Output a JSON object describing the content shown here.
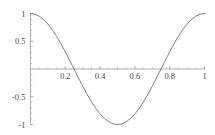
{
  "chart_data": {
    "type": "line",
    "title": "",
    "subtitle": "",
    "xlabel": "",
    "ylabel": "",
    "xlim": [
      0,
      1
    ],
    "ylim": [
      -1,
      1
    ],
    "grid": false,
    "legend": null,
    "legend_position": "none",
    "function": "cos(2*pi*x)",
    "x_ticks": [
      {
        "value": 0.2,
        "label": "0.2"
      },
      {
        "value": 0.4,
        "label": "0.4"
      },
      {
        "value": 0.6,
        "label": "0.6"
      },
      {
        "value": 0.8,
        "label": "0.8"
      },
      {
        "value": 1.0,
        "label": "1"
      }
    ],
    "x_minor_ticks": [
      0.05,
      0.1,
      0.15,
      0.25,
      0.3,
      0.35,
      0.45,
      0.5,
      0.55,
      0.65,
      0.7,
      0.75,
      0.85,
      0.9,
      0.95
    ],
    "y_ticks": [
      {
        "value": 1.0,
        "label": "1"
      },
      {
        "value": 0.5,
        "label": "0.5"
      },
      {
        "value": -0.5,
        "label": "-0.5"
      },
      {
        "value": -1.0,
        "label": "-1"
      }
    ],
    "y_minor_ticks": [
      0.9,
      0.8,
      0.7,
      0.6,
      0.4,
      0.3,
      0.2,
      0.1,
      -0.1,
      -0.2,
      -0.3,
      -0.4,
      -0.6,
      -0.7,
      -0.8,
      -0.9
    ],
    "series": [
      {
        "name": "cos(2*pi*x)",
        "color": "#6e6e72",
        "x": [
          0,
          0.025,
          0.05,
          0.075,
          0.1,
          0.125,
          0.15,
          0.175,
          0.2,
          0.225,
          0.25,
          0.275,
          0.3,
          0.325,
          0.35,
          0.375,
          0.4,
          0.425,
          0.45,
          0.475,
          0.5,
          0.525,
          0.55,
          0.575,
          0.6,
          0.625,
          0.65,
          0.675,
          0.7,
          0.725,
          0.75,
          0.775,
          0.8,
          0.825,
          0.85,
          0.875,
          0.9,
          0.925,
          0.95,
          0.975,
          1
        ],
        "values": [
          1,
          0.988,
          0.951,
          0.891,
          0.809,
          0.707,
          0.588,
          0.454,
          0.309,
          0.156,
          0,
          -0.156,
          -0.309,
          -0.454,
          -0.588,
          -0.707,
          -0.809,
          -0.891,
          -0.951,
          -0.988,
          -1,
          -0.988,
          -0.951,
          -0.891,
          -0.809,
          -0.707,
          -0.588,
          -0.454,
          -0.309,
          -0.156,
          0,
          0.156,
          0.309,
          0.454,
          0.588,
          0.707,
          0.809,
          0.891,
          0.951,
          0.988,
          1
        ]
      }
    ],
    "annotations": [],
    "colors": {
      "background": "#ffffff",
      "curve": "#6e6e72",
      "axis": "#8a8a8a",
      "tick_label": "#4a4a4a"
    }
  }
}
